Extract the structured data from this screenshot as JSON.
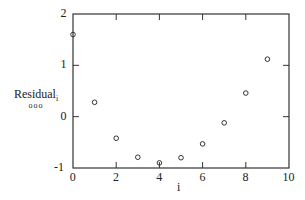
{
  "chart_data": {
    "type": "scatter",
    "title": "",
    "xlabel": "i",
    "ylabel": "Residual",
    "ylabel_subscript": "i",
    "legend_marker": "ooo",
    "xlim": [
      0,
      10
    ],
    "ylim": [
      -1,
      2
    ],
    "xticks": [
      0,
      2,
      4,
      6,
      8,
      10
    ],
    "yticks": [
      -1,
      0,
      1,
      2
    ],
    "grid": false,
    "marker": "open-circle",
    "x": [
      0,
      1,
      2,
      3,
      4,
      5,
      6,
      7,
      8,
      9
    ],
    "y": [
      1.6,
      0.28,
      -0.42,
      -0.79,
      -0.9,
      -0.8,
      -0.53,
      -0.12,
      0.46,
      1.12
    ]
  },
  "labels": {
    "xlabel": "i",
    "ylabel": "Residual",
    "ylabel_sub": "i",
    "legend_marker": "ooo"
  }
}
